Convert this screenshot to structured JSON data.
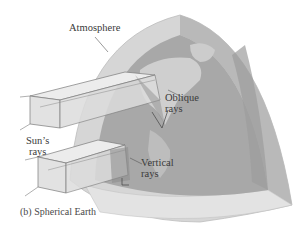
{
  "figure": {
    "caption": "(b)  Spherical Earth",
    "labels": {
      "atmosphere": "Atmosphere",
      "oblique_line1": "Oblique",
      "oblique_line2": "rays",
      "vertical_line1": "Vertical",
      "vertical_line2": "rays",
      "sun_line1": "Sun’s",
      "sun_line2": "rays"
    },
    "colors": {
      "atmosphere_outer": "#c9c9c9",
      "atmosphere_inner": "#b3b3b3",
      "earth": "#a6a6a6",
      "land": "#d2d2d2",
      "ray_box": "#e6e6e6",
      "ray_edge": "#7a7a7a",
      "text": "#3a3a3a"
    }
  }
}
